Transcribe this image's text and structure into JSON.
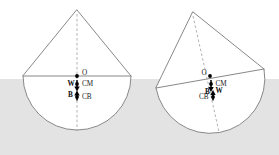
{
  "figure": {
    "background_color": "#ffffff",
    "water_color": "#e3e3e3",
    "outline_color": "#7a7a7a",
    "dash_color": "#9a9a9a",
    "vector_color": "#000000",
    "waterline_y": 79,
    "panels": [
      {
        "id": "upright",
        "name": "upright-body",
        "caption": "",
        "apex": {
          "x": 77,
          "y": 10
        },
        "chord_left": {
          "x": 23,
          "y": 76
        },
        "chord_right": {
          "x": 131,
          "y": 76
        },
        "center": {
          "x": 77,
          "y": 76
        },
        "radius": 54,
        "axis_bottom": {
          "x": 77,
          "y": 131
        },
        "points": [
          {
            "label": "O",
            "name": "point-o",
            "x": 77,
            "y": 76,
            "label_dx": 5,
            "label_dy": -1.5
          },
          {
            "label": "CM",
            "name": "point-cm",
            "x": 77,
            "y": 84,
            "label_dx": 5,
            "label_dy": 1.5
          },
          {
            "label": "CB",
            "name": "point-cb",
            "x": 77,
            "y": 97,
            "label_dx": 5,
            "label_dy": 2.5
          }
        ],
        "vectors": [
          {
            "label": "W",
            "name": "weight-vector",
            "x": 77,
            "y0": 80,
            "y1": 90,
            "dir": "down",
            "label_dx": -9,
            "label_dy": 1.5
          },
          {
            "label": "B",
            "name": "buoyancy-vector",
            "x": 77,
            "y0": 101,
            "y1": 91,
            "dir": "up",
            "label_dx": -8,
            "label_dy": -0.5
          }
        ]
      },
      {
        "id": "heeled",
        "name": "heeled-body",
        "caption": "",
        "apex": {
          "x": 193,
          "y": 12
        },
        "chord_left": {
          "x": 156,
          "y": 88
        },
        "chord_right": {
          "x": 264,
          "y": 69
        },
        "center": {
          "x": 210,
          "y": 78.5
        },
        "radius": 54,
        "axis_bottom": {
          "x": 219,
          "y": 132
        },
        "tilt_degrees": 10,
        "points": [
          {
            "label": "O",
            "name": "point-o",
            "x": 210,
            "y": 76,
            "label_dx": -7.5,
            "label_dy": -0.5
          },
          {
            "label": "CM",
            "name": "point-cm",
            "x": 211,
            "y": 84,
            "label_dx": 4.5,
            "label_dy": 1.5
          },
          {
            "label": "CB",
            "name": "point-cb",
            "x": 213,
            "y": 97,
            "label_dx": -13.5,
            "label_dy": 1.5
          }
        ],
        "vectors": [
          {
            "label": "W",
            "name": "weight-vector",
            "x": 211,
            "y0": 80,
            "y1": 91,
            "dir": "down",
            "label_dx": 4.5,
            "label_dy": 2.5
          },
          {
            "label": "B",
            "name": "buoyancy-vector",
            "x": 213,
            "y0": 101,
            "y1": 90,
            "dir": "up",
            "label_dx": -7.5,
            "label_dy": -1.5
          }
        ]
      }
    ],
    "legend_terms": [
      {
        "symbol": "O",
        "meaning": "centre of the circular section"
      },
      {
        "symbol": "CM",
        "meaning": "centre of mass"
      },
      {
        "symbol": "CB",
        "meaning": "centre of buoyancy"
      },
      {
        "symbol": "W",
        "meaning": "weight force (downward)"
      },
      {
        "symbol": "B",
        "meaning": "buoyancy force (upward)"
      }
    ]
  }
}
